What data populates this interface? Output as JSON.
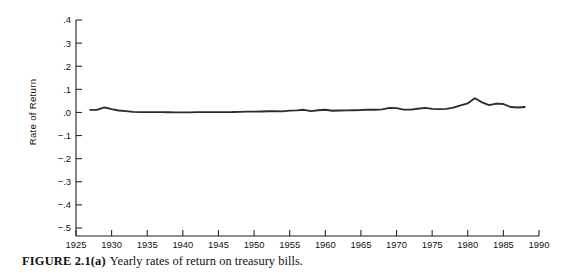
{
  "caption": {
    "label": "FIGURE 2.1(a)",
    "text": "Yearly rates of return on treasury bills."
  },
  "chart_data": {
    "type": "line",
    "title": "",
    "subtitle": "",
    "xlabel": "",
    "ylabel": "Rate of Return",
    "xlim": [
      1925,
      1990
    ],
    "ylim": [
      -0.5,
      0.4
    ],
    "grid": false,
    "legend": null,
    "x_tick_labels": [
      "1925",
      "1930",
      "1935",
      "1940",
      "1945",
      "1950",
      "1955",
      "1960",
      "1965",
      "1970",
      "1975",
      "1980",
      "1985",
      "1990"
    ],
    "x_ticks": [
      1925,
      1930,
      1935,
      1940,
      1945,
      1950,
      1955,
      1960,
      1965,
      1970,
      1975,
      1980,
      1985,
      1990
    ],
    "y_tick_labels": [
      ".4",
      ".3",
      ".2",
      ".1",
      ".0",
      "−.1",
      "−.2",
      "−.3",
      "−.4",
      "−.5"
    ],
    "y_ticks": [
      0.4,
      0.3,
      0.2,
      0.1,
      0.0,
      -0.1,
      -0.2,
      -0.3,
      -0.4,
      -0.5
    ],
    "series": [
      {
        "name": "Treasury bills",
        "x": [
          1927,
          1928,
          1929,
          1930,
          1931,
          1932,
          1933,
          1934,
          1935,
          1936,
          1937,
          1938,
          1939,
          1940,
          1941,
          1942,
          1943,
          1944,
          1945,
          1946,
          1947,
          1948,
          1949,
          1950,
          1951,
          1952,
          1953,
          1954,
          1955,
          1956,
          1957,
          1958,
          1959,
          1960,
          1961,
          1962,
          1963,
          1964,
          1965,
          1966,
          1967,
          1968,
          1969,
          1970,
          1971,
          1972,
          1973,
          1974,
          1975,
          1976,
          1977,
          1978,
          1979,
          1980,
          1981,
          1982,
          1983,
          1984,
          1985,
          1986,
          1987,
          1988
        ],
        "values": [
          0.0112,
          0.0118,
          0.0215,
          0.0145,
          0.0085,
          0.0055,
          0.0025,
          0.0015,
          0.0012,
          0.0012,
          0.0012,
          0.0008,
          0.0004,
          0.0003,
          0.0004,
          0.0012,
          0.0015,
          0.0015,
          0.0015,
          0.0015,
          0.0018,
          0.0028,
          0.0032,
          0.0035,
          0.004,
          0.005,
          0.006,
          0.0045,
          0.008,
          0.009,
          0.0115,
          0.006,
          0.0095,
          0.0115,
          0.0075,
          0.0085,
          0.009,
          0.0095,
          0.0105,
          0.0125,
          0.0115,
          0.0135,
          0.0195,
          0.0185,
          0.0125,
          0.012,
          0.016,
          0.0195,
          0.0155,
          0.0145,
          0.0155,
          0.0205,
          0.031,
          0.0395,
          0.0615,
          0.0435,
          0.0315,
          0.0385,
          0.0365,
          0.0235,
          0.0215,
          0.0235
        ]
      }
    ]
  }
}
